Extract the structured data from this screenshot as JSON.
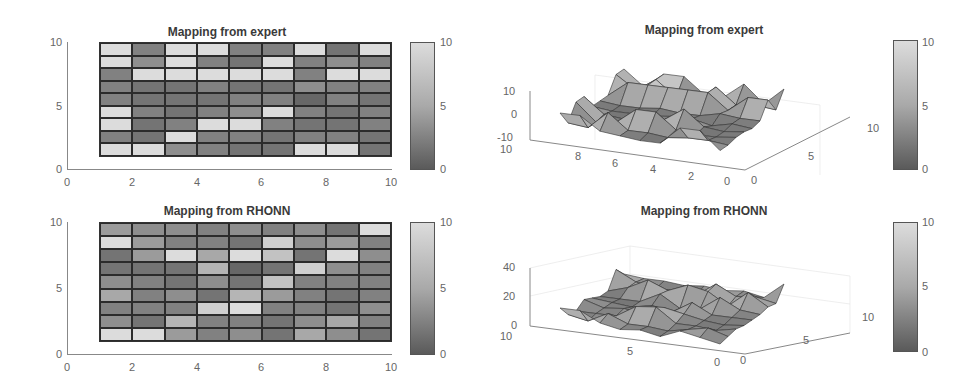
{
  "chart_data": [
    {
      "type": "heatmap",
      "title": "Mapping from expert",
      "xlabel": "",
      "ylabel": "",
      "xlim": [
        0,
        10
      ],
      "ylim": [
        0,
        10
      ],
      "xticks": [
        "0",
        "2",
        "4",
        "6",
        "8",
        "10"
      ],
      "yticks": [
        "0",
        "5",
        "10"
      ],
      "colorbar": {
        "min": 0,
        "max": 10,
        "ticks": [
          "0",
          "5",
          "10"
        ]
      },
      "grid_rows_top_to_bottom": [
        [
          10,
          3,
          10,
          10,
          3,
          3,
          10,
          2,
          10
        ],
        [
          10,
          4,
          10,
          3,
          2,
          10,
          3,
          4,
          3
        ],
        [
          3,
          10,
          10,
          10,
          10,
          10,
          3,
          10,
          10
        ],
        [
          3,
          2,
          2,
          3,
          2,
          2,
          4,
          3,
          3
        ],
        [
          3,
          2,
          2,
          2,
          3,
          3,
          1,
          3,
          2
        ],
        [
          10,
          3,
          2,
          3,
          4,
          10,
          3,
          2,
          3
        ],
        [
          10,
          2,
          3,
          10,
          10,
          3,
          2,
          2,
          3
        ],
        [
          3,
          2,
          10,
          3,
          3,
          2,
          3,
          3,
          2
        ],
        [
          10,
          10,
          4,
          3,
          2,
          2,
          10,
          10,
          2
        ]
      ]
    },
    {
      "type": "surface",
      "title": "Mapping from expert",
      "zticks": [
        "-10",
        "0",
        "10"
      ],
      "xticks": [
        "10",
        "8",
        "6",
        "4",
        "2",
        "0"
      ],
      "yticks": [
        "0",
        "5",
        "10"
      ],
      "zlim": [
        -10,
        10
      ],
      "colorbar": {
        "min": 0,
        "max": 10,
        "ticks": [
          "0",
          "5",
          "10"
        ]
      }
    },
    {
      "type": "heatmap",
      "title": "Mapping from RHONN",
      "xlim": [
        0,
        10
      ],
      "ylim": [
        0,
        10
      ],
      "xticks": [
        "0",
        "2",
        "4",
        "6",
        "8",
        "10"
      ],
      "yticks": [
        "0",
        "5",
        "10"
      ],
      "colorbar": {
        "min": 0,
        "max": 10,
        "ticks": [
          "0",
          "5",
          "10"
        ]
      },
      "grid_rows_top_to_bottom": [
        [
          5,
          4,
          4,
          3,
          4,
          3,
          4,
          2,
          10
        ],
        [
          10,
          5,
          3,
          3,
          2,
          9,
          4,
          5,
          3
        ],
        [
          2,
          5,
          10,
          6,
          10,
          8,
          2,
          10,
          4
        ],
        [
          2,
          2,
          2,
          7,
          1,
          2,
          9,
          4,
          3
        ],
        [
          4,
          3,
          2,
          4,
          2,
          8,
          3,
          3,
          3
        ],
        [
          6,
          3,
          4,
          2,
          7,
          5,
          3,
          2,
          3
        ],
        [
          3,
          3,
          3,
          9,
          10,
          3,
          3,
          2,
          4
        ],
        [
          4,
          2,
          7,
          3,
          3,
          2,
          4,
          6,
          3
        ],
        [
          10,
          10,
          5,
          3,
          4,
          2,
          6,
          4,
          2
        ]
      ]
    },
    {
      "type": "surface",
      "title": "Mapping from RHONN",
      "zticks": [
        "0",
        "20",
        "40"
      ],
      "xticks": [
        "10",
        "5",
        "0"
      ],
      "yticks": [
        "0",
        "5",
        "10"
      ],
      "zlim": [
        0,
        40
      ],
      "colorbar": {
        "min": 0,
        "max": 10,
        "ticks": [
          "0",
          "5",
          "10"
        ]
      }
    }
  ],
  "labels": {
    "t1": "Mapping from expert",
    "t2": "Mapping from expert",
    "t3": "Mapping from RHONN",
    "t4": "Mapping from RHONN",
    "h_xticks": [
      "0",
      "2",
      "4",
      "6",
      "8",
      "10"
    ],
    "h_yticks": [
      "0",
      "5",
      "10"
    ],
    "cb_ticks": [
      "0",
      "5",
      "10"
    ],
    "s1_z": [
      "-10",
      "0",
      "10"
    ],
    "s1_x": [
      "10",
      "8",
      "6",
      "4",
      "2",
      "0"
    ],
    "s1_y": [
      "0",
      "5",
      "10"
    ],
    "s2_z": [
      "0",
      "20",
      "40"
    ],
    "s2_x": [
      "10",
      "5",
      "0"
    ],
    "s2_y": [
      "0",
      "5",
      "10"
    ]
  }
}
